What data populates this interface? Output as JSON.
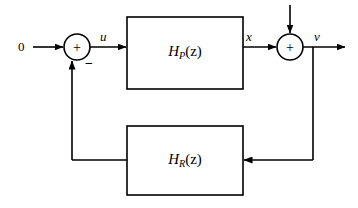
{
  "diagram": {
    "type": "control-system-block-diagram",
    "width": 358,
    "height": 208,
    "stroke_color": "#000000",
    "background_color": "#ffffff",
    "signals": {
      "reference_input": "0",
      "error_signal": "u",
      "plant_output": "x",
      "system_output": "v"
    },
    "summing_junctions": [
      {
        "id": "left-summer",
        "cx": 77,
        "cy": 47,
        "r": 13,
        "inside_sign": "+",
        "feedback_sign": "−"
      },
      {
        "id": "right-summer",
        "cx": 290,
        "cy": 47,
        "r": 13,
        "inside_sign": "+"
      }
    ],
    "blocks": [
      {
        "id": "plant-block",
        "transfer_function": "H",
        "subscript": "P",
        "argument": "(z)",
        "x": 127,
        "y": 17,
        "width": 116,
        "height": 72
      },
      {
        "id": "feedback-block",
        "transfer_function": "H",
        "subscript": "R",
        "argument": "(z)",
        "x": 127,
        "y": 126,
        "width": 116,
        "height": 69
      }
    ]
  }
}
